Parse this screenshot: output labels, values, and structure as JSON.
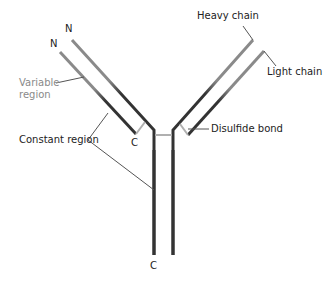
{
  "labels": {
    "heavy_chain": "Heavy chain",
    "light_chain": "Light chain",
    "variable_region_line1": "Variable",
    "variable_region_line2": "region",
    "constant_region": "Constant region",
    "disulfide_bond": "Disulfide bond"
  },
  "terminals": {
    "n_heavy_left": "N",
    "n_light_left": "N",
    "c_light_left": "C",
    "c_heavy_stem": "C"
  },
  "colors": {
    "constant": "#333333",
    "variable": "#8a8a8a",
    "bond": "#b0b0b0",
    "leader": "#555555"
  }
}
